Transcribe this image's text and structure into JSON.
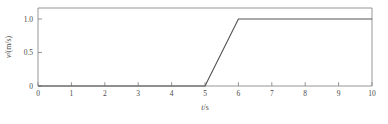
{
  "chart_data": {
    "type": "line",
    "title": "",
    "xlabel": "t/s",
    "ylabel": "v/(m/s)",
    "xlim": [
      0,
      10
    ],
    "ylim": [
      0,
      1.12
    ],
    "grid": false,
    "legend": null,
    "xticks": [
      0,
      1,
      2,
      3,
      4,
      5,
      6,
      7,
      8,
      9,
      10
    ],
    "xtick_labels": [
      "0",
      "1",
      "2",
      "3",
      "4",
      "5",
      "6",
      "7",
      "8",
      "9",
      "10"
    ],
    "yticks": [
      0,
      0.5,
      1.0
    ],
    "ytick_labels": [
      "0",
      "0.5",
      "1.0"
    ],
    "series": [
      {
        "name": "v(t)",
        "color": "#555555",
        "x": [
          0,
          5,
          6,
          10
        ],
        "values": [
          0,
          0,
          1.0,
          1.0
        ]
      }
    ],
    "points": [
      {
        "x": 0,
        "y": 0
      },
      {
        "x": 5,
        "y": 0
      },
      {
        "x": 6,
        "y": 1.0
      },
      {
        "x": 10,
        "y": 1.0
      }
    ],
    "axis_title_parts": {
      "x_symbol": "t",
      "x_unit": "/s",
      "y_symbol": "v",
      "y_unit": "/(m/s)"
    }
  }
}
